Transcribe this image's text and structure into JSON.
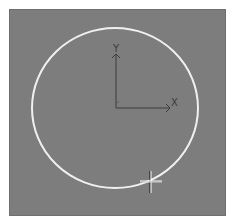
{
  "viewport": {
    "background": "#7d7d7d",
    "border_color": "#ffffff"
  },
  "axes": {
    "origin": [
      116,
      108
    ],
    "x_axis_end": [
      170,
      108
    ],
    "y_axis_end": [
      116,
      55
    ],
    "x_label": "X",
    "y_label": "Y",
    "color": "#3a3a3a"
  },
  "circle": {
    "center": [
      115,
      108
    ],
    "rx": 83,
    "ry": 80,
    "color": "#f2f2f2"
  },
  "cursor": {
    "type": "crosshair",
    "position": [
      150,
      181
    ]
  }
}
